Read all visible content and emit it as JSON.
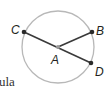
{
  "diagram": {
    "type": "circle-with-segments",
    "colors": {
      "circle": "#b8b8b8",
      "segment": "#3a3a3a",
      "point": "#2b2b2b",
      "center_point": "#9a9a9a",
      "label": "#231f20"
    },
    "circle": {
      "cx": 58,
      "cy": 47,
      "r": 36
    },
    "points": [
      {
        "name": "A",
        "x": 58,
        "y": 47,
        "role": "center"
      },
      {
        "name": "B",
        "x": 92,
        "y": 32,
        "role": "on-circle"
      },
      {
        "name": "C",
        "x": 24,
        "y": 32,
        "role": "on-circle"
      },
      {
        "name": "D",
        "x": 91,
        "y": 63,
        "role": "on-circle"
      }
    ],
    "segments": [
      {
        "from": "C",
        "to": "D"
      },
      {
        "from": "A",
        "to": "B"
      }
    ],
    "labels": {
      "A": "A",
      "B": "B",
      "C": "C",
      "D": "D"
    }
  },
  "text_fragment": "ula"
}
